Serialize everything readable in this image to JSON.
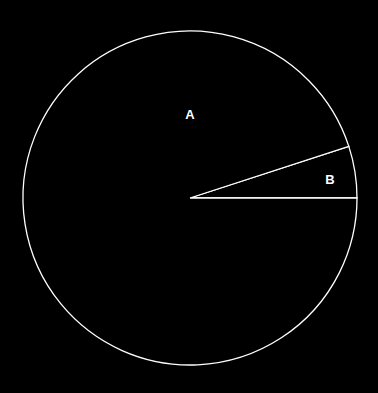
{
  "chart_data": {
    "type": "pie",
    "title": "",
    "categories": [
      "A",
      "B"
    ],
    "values": [
      95,
      5
    ],
    "labels": [
      "A",
      "B"
    ],
    "colors": {
      "background": "#000000",
      "stroke": "#ffffff",
      "fill": "#000000"
    },
    "legend": "none",
    "start_angle_deg": 0,
    "direction": "counterclockwise"
  },
  "labels": {
    "a": "A",
    "b": "B"
  }
}
